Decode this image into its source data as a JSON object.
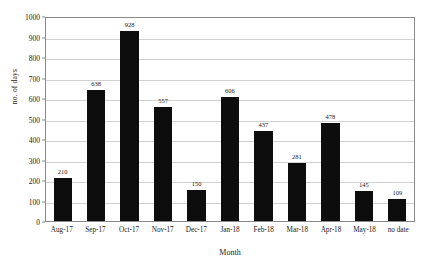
{
  "chart_data": {
    "type": "bar",
    "title": "",
    "xlabel": "Month",
    "ylabel": "no. of days",
    "categories": [
      "Aug-17",
      "Sep-17",
      "Oct-17",
      "Nov-17",
      "Dec-17",
      "Jan-18",
      "Feb-18",
      "Mar-18",
      "Apr-18",
      "May-18",
      "no date"
    ],
    "values": [
      210,
      638,
      928,
      557,
      150,
      606,
      437,
      281,
      478,
      145,
      109
    ],
    "ylim": [
      0,
      1000
    ],
    "ytick_step": 100,
    "yticks": [
      "1000",
      "900",
      "800",
      "700",
      "600",
      "500",
      "400",
      "300",
      "200",
      "100",
      "0"
    ],
    "grid": "horizontal",
    "legend": "none",
    "bar_color": "#0d0d0d",
    "grid_color": "#d2d2d2",
    "axis_color": "#8a8a8a",
    "background": "#ffffff"
  }
}
